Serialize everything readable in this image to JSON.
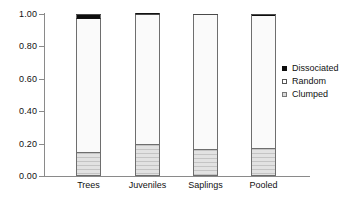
{
  "chart_data": {
    "type": "bar",
    "subtype": "stacked-proportional",
    "title": "",
    "xlabel": "",
    "ylabel": "",
    "categories": [
      "Trees",
      "Juveniles",
      "Saplings",
      "Pooled"
    ],
    "series": [
      {
        "name": "Clumped",
        "values": [
          0.14,
          0.19,
          0.16,
          0.165
        ]
      },
      {
        "name": "Random",
        "values": [
          0.83,
          0.805,
          0.84,
          0.82
        ]
      },
      {
        "name": "Dissociated",
        "values": [
          0.03,
          0.005,
          0.0,
          0.015
        ]
      }
    ],
    "ylim": [
      0.0,
      1.0
    ],
    "ytick_values": [
      0.0,
      0.2,
      0.4,
      0.6,
      0.8,
      1.0
    ],
    "ytick_labels": [
      "0.00",
      "0.20",
      "0.40",
      "0.60",
      "0.80",
      "1.00"
    ],
    "grid": false,
    "legend_position": "right",
    "legend_entries": [
      "Dissociated",
      "Random",
      "Clumped"
    ],
    "colors": {
      "dissociated": "#0d0d0d",
      "random": "#fafafa",
      "clumped": "#d8d8d8",
      "axis": "#8a8a8a",
      "bar_outline": "#6e6e6e",
      "background": "#ffffff",
      "text": "#111111"
    }
  },
  "axis": {
    "y": {
      "labels": [
        "1.00",
        "0.80",
        "0.60",
        "0.40",
        "0.20",
        "0.00"
      ]
    },
    "x": {
      "labels": [
        "Trees",
        "Juveniles",
        "Saplings",
        "Pooled"
      ]
    }
  },
  "legend": {
    "items": [
      {
        "label": "Dissociated",
        "swatch": "filled-black-square-icon"
      },
      {
        "label": "Random",
        "swatch": "empty-white-square-icon"
      },
      {
        "label": "Clumped",
        "swatch": "gray-hatched-square-icon"
      }
    ]
  }
}
